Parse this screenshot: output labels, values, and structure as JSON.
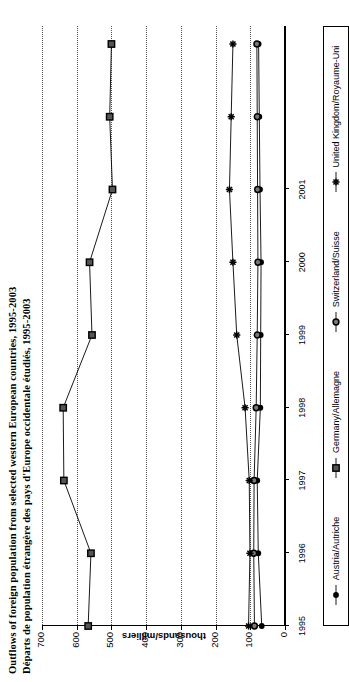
{
  "title": {
    "line_en": "Outflows of foreign population from selected western European countries, 1995-2003",
    "line_fr": "Départs de population étrangère des pays d'Europe occidentale étudiés, 1995-2003"
  },
  "axis": {
    "value_axis_title": "thousands/milliers",
    "value_ticks": [
      "0",
      "100",
      "200",
      "300",
      "400",
      "500",
      "600",
      "700"
    ],
    "year_ticks": [
      "1995",
      "1996",
      "1997",
      "1998",
      "1999",
      "2000",
      "2001"
    ]
  },
  "legend": {
    "items": [
      {
        "label": "Austria/Autriche",
        "marker": "filled-circle-marker",
        "color": "#000000"
      },
      {
        "label": "Germany/Allemagne",
        "marker": "filled-square-marker",
        "color": "#000000"
      },
      {
        "label": "Switzerland/Suisse",
        "marker": "open-circle-marker",
        "color": "#000000"
      },
      {
        "label": "United Kingdom/Royaume-Uni",
        "marker": "asterisk-marker",
        "color": "#000000"
      }
    ]
  },
  "chart_data": {
    "type": "line",
    "title": "Outflows of foreign population from selected western European countries, 1995-2003",
    "subtitle": "Départs de population étrangère des pays d'Europe occidentale étudiés, 1995-2003",
    "xlabel": "",
    "ylabel": "thousands/milliers",
    "x": [
      "1995",
      "1996",
      "1997",
      "1998",
      "1999",
      "2000",
      "2001",
      "2002",
      "2003"
    ],
    "ylim": [
      0,
      700
    ],
    "yticks": [
      0,
      100,
      200,
      300,
      400,
      500,
      600,
      700
    ],
    "grid": true,
    "legend_position": "bottom",
    "orientation": "rotated-90-ccw",
    "series": [
      {
        "name": "Austria/Autriche",
        "marker": "filled-circle",
        "values": [
          67,
          77,
          80,
          71,
          70,
          69,
          72,
          74,
          76
        ]
      },
      {
        "name": "Germany/Allemagne",
        "marker": "filled-square",
        "values": [
          567,
          559,
          637,
          639,
          556,
          563,
          497,
          505,
          500
        ]
      },
      {
        "name": "Switzerland/Suisse",
        "marker": "open-circle",
        "values": [
          88,
          90,
          89,
          83,
          80,
          78,
          79,
          80,
          81
        ]
      },
      {
        "name": "United Kingdom/Royaume-Uni",
        "marker": "asterisk",
        "values": [
          105,
          101,
          103,
          115,
          139,
          150,
          160,
          155,
          150
        ]
      }
    ]
  }
}
